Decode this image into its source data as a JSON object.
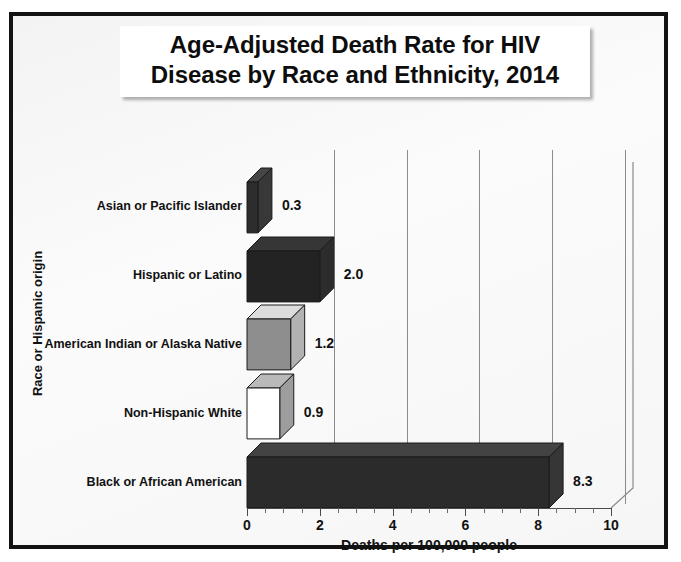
{
  "title": {
    "line1": "Age-Adjusted Death Rate for HIV",
    "line2": "Disease by Race and Ethnicity, 2014"
  },
  "chart_data": {
    "type": "bar",
    "orientation": "horizontal",
    "title": "Age-Adjusted Death Rate for HIV Disease by Race and Ethnicity, 2014",
    "xlabel": "Deaths per 100,000 people",
    "ylabel": "Race or Hispanic origin",
    "xlim": [
      0,
      10
    ],
    "xticks": [
      "0",
      "2",
      "4",
      "6",
      "8",
      "10"
    ],
    "xtick_values": [
      0,
      2,
      4,
      6,
      8,
      10
    ],
    "minor_tick_step": 0.5,
    "grid": "vertical",
    "legend": "none",
    "categories": [
      "Asian or Pacific Islander",
      "Hispanic or Latino",
      "American Indian or Alaska Native",
      "Non-Hispanic White",
      "Black or African American"
    ],
    "values": [
      0.3,
      2.0,
      1.2,
      0.9,
      8.3
    ],
    "data_labels": [
      "0.3",
      "2.0",
      "1.2",
      "0.9",
      "8.3"
    ],
    "bar_colors": [
      "#2d2d2d",
      "#232323",
      "#8e8e8e",
      "#ffffff",
      "#2b2b2b"
    ]
  },
  "colors": {
    "frame": "#131313",
    "background": "#f6f6f6",
    "gridline": "#8b8b8b",
    "text": "#111111"
  }
}
